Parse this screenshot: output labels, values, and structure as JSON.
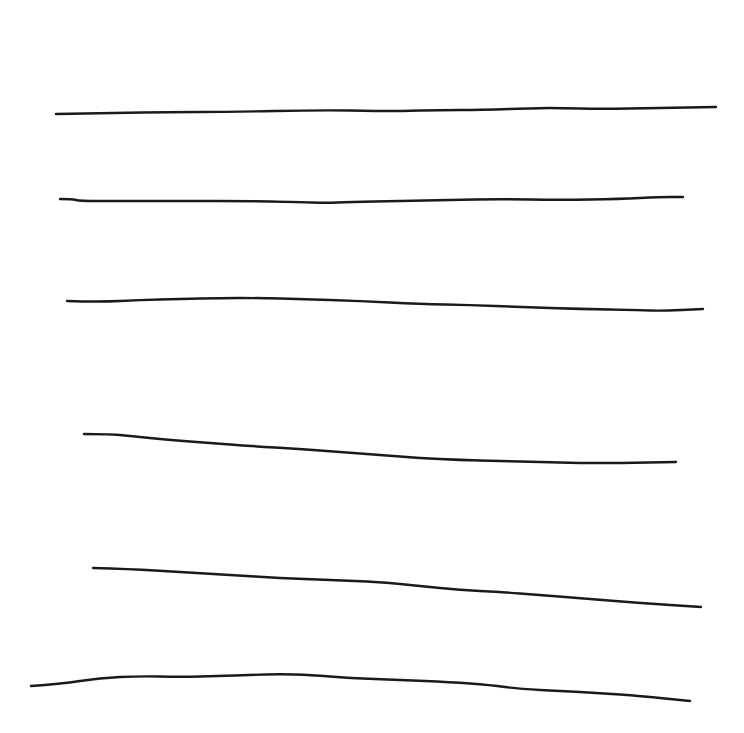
{
  "canvas": {
    "width": 744,
    "height": 733,
    "background": "#ffffff"
  },
  "ink": {
    "color": "#1a1a1a",
    "width": 2.4
  },
  "strokes": [
    {
      "name": "line-1",
      "points": [
        [
          56,
          114
        ],
        [
          120,
          113
        ],
        [
          165,
          112
        ],
        [
          230,
          112
        ],
        [
          320,
          110
        ],
        [
          380,
          111
        ],
        [
          400,
          111
        ],
        [
          440,
          110
        ],
        [
          480,
          110
        ],
        [
          540,
          108
        ],
        [
          560,
          108
        ],
        [
          600,
          109
        ],
        [
          660,
          108
        ],
        [
          716,
          107
        ]
      ]
    },
    {
      "name": "line-2",
      "points": [
        [
          60,
          199
        ],
        [
          72,
          199
        ],
        [
          80,
          201
        ],
        [
          120,
          201
        ],
        [
          190,
          201
        ],
        [
          240,
          201
        ],
        [
          300,
          202
        ],
        [
          325,
          203
        ],
        [
          350,
          202
        ],
        [
          400,
          201
        ],
        [
          450,
          200
        ],
        [
          500,
          199
        ],
        [
          560,
          200
        ],
        [
          620,
          199
        ],
        [
          660,
          197
        ],
        [
          683,
          197
        ]
      ]
    },
    {
      "name": "line-3",
      "points": [
        [
          67,
          301
        ],
        [
          100,
          302
        ],
        [
          140,
          300
        ],
        [
          180,
          299
        ],
        [
          220,
          298
        ],
        [
          260,
          298
        ],
        [
          300,
          299
        ],
        [
          360,
          301
        ],
        [
          420,
          304
        ],
        [
          470,
          305
        ],
        [
          520,
          307
        ],
        [
          580,
          309
        ],
        [
          640,
          310
        ],
        [
          660,
          311
        ],
        [
          703,
          309
        ]
      ]
    },
    {
      "name": "line-4",
      "points": [
        [
          84,
          434
        ],
        [
          110,
          434
        ],
        [
          140,
          437
        ],
        [
          170,
          440
        ],
        [
          210,
          443
        ],
        [
          250,
          446
        ],
        [
          300,
          449
        ],
        [
          340,
          452
        ],
        [
          380,
          455
        ],
        [
          420,
          458
        ],
        [
          460,
          460
        ],
        [
          500,
          461
        ],
        [
          540,
          462
        ],
        [
          580,
          463
        ],
        [
          620,
          463
        ],
        [
          676,
          462
        ]
      ]
    },
    {
      "name": "line-5",
      "points": [
        [
          93,
          568
        ],
        [
          130,
          569
        ],
        [
          180,
          572
        ],
        [
          230,
          575
        ],
        [
          280,
          578
        ],
        [
          330,
          580
        ],
        [
          380,
          582
        ],
        [
          420,
          586
        ],
        [
          460,
          590
        ],
        [
          500,
          592
        ],
        [
          540,
          595
        ],
        [
          590,
          599
        ],
        [
          640,
          603
        ],
        [
          701,
          607
        ]
      ]
    },
    {
      "name": "line-6",
      "points": [
        [
          31,
          686
        ],
        [
          60,
          684
        ],
        [
          100,
          678
        ],
        [
          140,
          676
        ],
        [
          180,
          677
        ],
        [
          220,
          676
        ],
        [
          250,
          675
        ],
        [
          280,
          674
        ],
        [
          310,
          675
        ],
        [
          350,
          678
        ],
        [
          400,
          680
        ],
        [
          450,
          682
        ],
        [
          490,
          685
        ],
        [
          520,
          689
        ],
        [
          560,
          691
        ],
        [
          600,
          693
        ],
        [
          640,
          696
        ],
        [
          690,
          701
        ]
      ]
    }
  ]
}
